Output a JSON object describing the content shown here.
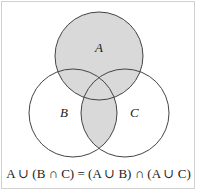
{
  "diagram": {
    "type": "venn",
    "sets": [
      {
        "label": "A",
        "cx": 99,
        "cy": 56,
        "r": 44
      },
      {
        "label": "B",
        "cx": 73,
        "cy": 113,
        "r": 44
      },
      {
        "label": "C",
        "cx": 125,
        "cy": 113,
        "r": 44
      }
    ],
    "shaded_region": "A ∪ (B ∩ C)",
    "colors": {
      "shade": "#d9d9d9",
      "stroke": "#444444",
      "border": "#d0d0d0"
    },
    "formula": {
      "left": "A ∪ (B ∩ C)",
      "equals": "=",
      "right": "(A ∪ B) ∩ (A ∪ C)",
      "full": "A ∪ (B ∩ C) = (A ∪ B) ∩ (A ∪ C)"
    }
  }
}
